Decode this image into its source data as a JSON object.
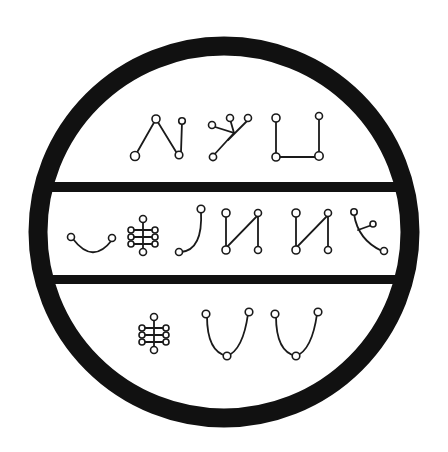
{
  "diagram": {
    "title": "",
    "type": "sigil",
    "colors": {
      "ink": "#111111",
      "background": "#ffffff"
    },
    "outer_ring": "circle",
    "dividers": 2,
    "rows": [
      {
        "name": "top-row",
        "glyphs": [
          "chevron-glyph",
          "fork-glyph",
          "cup-square-glyph"
        ]
      },
      {
        "name": "middle-row",
        "glyphs": [
          "smile-arc-glyph",
          "ladder-glyph",
          "hook-glyph",
          "zigzag-glyph",
          "zigzag-glyph",
          "branch-arc-glyph"
        ]
      },
      {
        "name": "bottom-row",
        "glyphs": [
          "ladder-glyph",
          "u-curve-glyph",
          "u-curve-glyph"
        ]
      }
    ]
  }
}
